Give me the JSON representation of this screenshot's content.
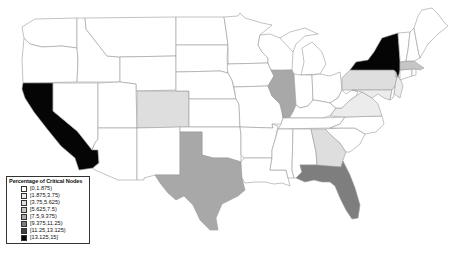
{
  "map": {
    "title": "Percentage of Critical Nodes by State",
    "region": "United States",
    "stroke_color": "#9a9a9a",
    "states": [
      {
        "id": "WA",
        "name": "Washington",
        "bin": 0
      },
      {
        "id": "OR",
        "name": "Oregon",
        "bin": 0
      },
      {
        "id": "CA",
        "name": "California",
        "bin": 7
      },
      {
        "id": "ID",
        "name": "Idaho",
        "bin": 0
      },
      {
        "id": "NV",
        "name": "Nevada",
        "bin": 0
      },
      {
        "id": "MT",
        "name": "Montana",
        "bin": 0
      },
      {
        "id": "WY",
        "name": "Wyoming",
        "bin": 0
      },
      {
        "id": "UT",
        "name": "Utah",
        "bin": 0
      },
      {
        "id": "AZ",
        "name": "Arizona",
        "bin": 0
      },
      {
        "id": "CO",
        "name": "Colorado",
        "bin": 2
      },
      {
        "id": "NM",
        "name": "New Mexico",
        "bin": 0
      },
      {
        "id": "ND",
        "name": "North Dakota",
        "bin": 0
      },
      {
        "id": "SD",
        "name": "South Dakota",
        "bin": 0
      },
      {
        "id": "NE",
        "name": "Nebraska",
        "bin": 0
      },
      {
        "id": "KS",
        "name": "Kansas",
        "bin": 0
      },
      {
        "id": "OK",
        "name": "Oklahoma",
        "bin": 0
      },
      {
        "id": "TX",
        "name": "Texas",
        "bin": 4
      },
      {
        "id": "MN",
        "name": "Minnesota",
        "bin": 0
      },
      {
        "id": "IA",
        "name": "Iowa",
        "bin": 0
      },
      {
        "id": "MO",
        "name": "Missouri",
        "bin": 0
      },
      {
        "id": "AR",
        "name": "Arkansas",
        "bin": 0
      },
      {
        "id": "LA",
        "name": "Louisiana",
        "bin": 0
      },
      {
        "id": "WI",
        "name": "Wisconsin",
        "bin": 0
      },
      {
        "id": "IL",
        "name": "Illinois",
        "bin": 4
      },
      {
        "id": "MI",
        "name": "Michigan",
        "bin": 0
      },
      {
        "id": "IN",
        "name": "Indiana",
        "bin": 0
      },
      {
        "id": "OH",
        "name": "Ohio",
        "bin": 0
      },
      {
        "id": "KY",
        "name": "Kentucky",
        "bin": 0
      },
      {
        "id": "TN",
        "name": "Tennessee",
        "bin": 0
      },
      {
        "id": "MS",
        "name": "Mississippi",
        "bin": 0
      },
      {
        "id": "AL",
        "name": "Alabama",
        "bin": 0
      },
      {
        "id": "GA",
        "name": "Georgia",
        "bin": 2
      },
      {
        "id": "FL",
        "name": "Florida",
        "bin": 5
      },
      {
        "id": "SC",
        "name": "South Carolina",
        "bin": 0
      },
      {
        "id": "NC",
        "name": "North Carolina",
        "bin": 0
      },
      {
        "id": "VA",
        "name": "Virginia",
        "bin": 1
      },
      {
        "id": "WV",
        "name": "West Virginia",
        "bin": 0
      },
      {
        "id": "PA",
        "name": "Pennsylvania",
        "bin": 2
      },
      {
        "id": "NY",
        "name": "New York",
        "bin": 7
      },
      {
        "id": "NJ",
        "name": "New Jersey",
        "bin": 1
      },
      {
        "id": "MD",
        "name": "Maryland",
        "bin": 1
      },
      {
        "id": "DE",
        "name": "Delaware",
        "bin": 0
      },
      {
        "id": "CT",
        "name": "Connecticut",
        "bin": 0
      },
      {
        "id": "RI",
        "name": "Rhode Island",
        "bin": 0
      },
      {
        "id": "MA",
        "name": "Massachusetts",
        "bin": 3
      },
      {
        "id": "VT",
        "name": "Vermont",
        "bin": 0
      },
      {
        "id": "NH",
        "name": "New Hampshire",
        "bin": 0
      },
      {
        "id": "ME",
        "name": "Maine",
        "bin": 0
      }
    ]
  },
  "legend": {
    "title": "Percentage of Critical Nodes",
    "bins": [
      {
        "label": "[0,1.875)",
        "color": "#ffffff"
      },
      {
        "label": "[1.875,3.75)",
        "color": "#ececec"
      },
      {
        "label": "[3.75,5.625)",
        "color": "#dedede"
      },
      {
        "label": "[5.625,7.5)",
        "color": "#c6c6c6"
      },
      {
        "label": "[7.5,9.375)",
        "color": "#a8a8a8"
      },
      {
        "label": "[9.375,11.25)",
        "color": "#7e7e7e"
      },
      {
        "label": "[11.25,13.125)",
        "color": "#404040"
      },
      {
        "label": "[13.125,15]",
        "color": "#050505"
      }
    ]
  }
}
